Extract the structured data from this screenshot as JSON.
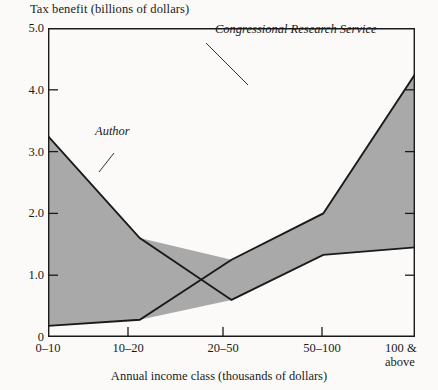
{
  "axes": {
    "y_title": "Tax benefit (billions of dollars)",
    "x_title": "Annual income class (thousands of dollars)",
    "y_ticks": [
      "0",
      "1.0",
      "2.0",
      "3.0",
      "4.0",
      "5.0"
    ],
    "x_ticks": [
      "0–10",
      "10–20",
      "20–50",
      "50–100",
      "100 &\nabove"
    ],
    "x_tick_line1": [
      "0–10",
      "10–20",
      "20–50",
      "50–100",
      "100 &"
    ],
    "x_tick_line2": [
      "",
      "",
      "",
      "",
      "above"
    ]
  },
  "annotations": {
    "author": "Author",
    "crs": "Congressional Research Service"
  },
  "colors": {
    "band_fill": "#a9a9a9",
    "line": "#1a1a1a",
    "axis": "#1a1a1a",
    "background": "#fbfaf8"
  },
  "chart_data": {
    "type": "line",
    "title": "",
    "xlabel": "Annual income class (thousands of dollars)",
    "ylabel": "Tax benefit (billions of dollars)",
    "categories": [
      "0–10",
      "10–20",
      "20–50",
      "50–100",
      "100 & above"
    ],
    "ylim": [
      0,
      5.0
    ],
    "yticks": [
      0,
      1.0,
      2.0,
      3.0,
      4.0,
      5.0
    ],
    "grid": false,
    "legend": "inline-annotations",
    "fill_between": true,
    "series": [
      {
        "name": "Author",
        "values": [
          3.25,
          1.6,
          0.6,
          1.33,
          1.45
        ]
      },
      {
        "name": "Congressional Research Service",
        "values": [
          0.18,
          0.28,
          1.25,
          2.0,
          4.25
        ]
      }
    ]
  }
}
